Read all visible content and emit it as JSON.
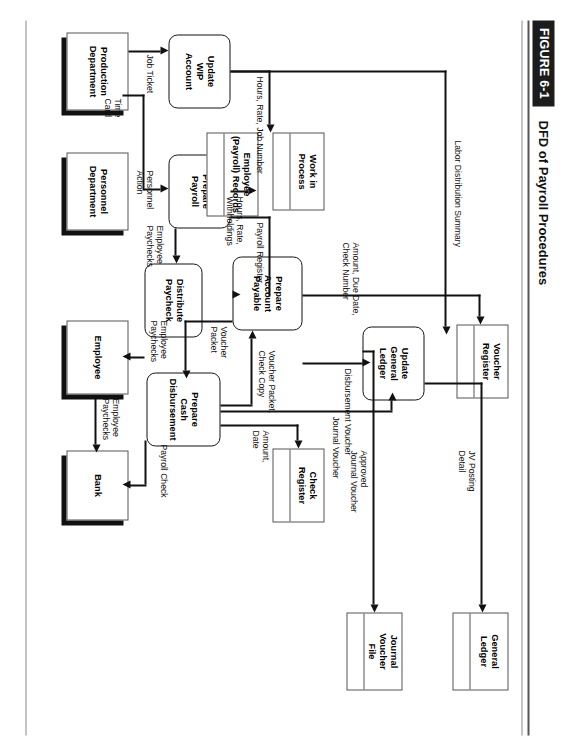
{
  "figure": {
    "badge": "FIGURE 6-1",
    "title": "DFD of Payroll Procedures"
  },
  "diagram": {
    "type": "data-flow-diagram",
    "processes": [
      {
        "id": "update_wip",
        "label": "Update\nWIP\nAccount"
      },
      {
        "id": "prepare_payroll",
        "label": "Prepare\nPayroll"
      },
      {
        "id": "prepare_ap",
        "label": "Prepare\nAccount\nPayable"
      },
      {
        "id": "distribute_paycheck",
        "label": "Distribute\nPaycheck"
      },
      {
        "id": "prepare_cash_disb",
        "label": "Prepare\nCash\nDisbursement"
      },
      {
        "id": "update_gl",
        "label": "Update\nGeneral\nLedger"
      }
    ],
    "data_stores": [
      {
        "id": "work_in_process",
        "label": "Work in\nProcess"
      },
      {
        "id": "employee_payroll_records",
        "label": "Employee\n(Payroll) Records"
      },
      {
        "id": "voucher_register",
        "label": "Voucher\nRegister"
      },
      {
        "id": "check_register",
        "label": "Check\nRegister"
      },
      {
        "id": "general_ledger",
        "label": "General\nLedger"
      },
      {
        "id": "journal_voucher_file",
        "label": "Journal\nVoucher\nFile"
      }
    ],
    "entities": [
      {
        "id": "production_department",
        "label": "Production\nDepartment"
      },
      {
        "id": "personnel_department",
        "label": "Personnel\nDepartment"
      },
      {
        "id": "employee",
        "label": "Employee"
      },
      {
        "id": "bank",
        "label": "Bank"
      }
    ],
    "flows": [
      {
        "id": "job_ticket",
        "label": "Job Ticket"
      },
      {
        "id": "time_card",
        "label": "Time\nCard"
      },
      {
        "id": "personnel_action",
        "label": "Personnel\nAction"
      },
      {
        "id": "hours_rate_job_number",
        "label": "Hours, Rate, Job Number"
      },
      {
        "id": "hours_rate_withholdings",
        "label": "Hours, Rate,\nWithholdings"
      },
      {
        "id": "labor_distribution_summary",
        "label": "Labor Distribution Summary"
      },
      {
        "id": "payroll_register",
        "label": "Payroll Register"
      },
      {
        "id": "employee_paychecks_1",
        "label": "Employee\nPaychecks"
      },
      {
        "id": "employee_paychecks_2",
        "label": "Employee\nPaychecks"
      },
      {
        "id": "employee_paychecks_3",
        "label": "Employee\nPaychecks"
      },
      {
        "id": "amount_due_date_check_number",
        "label": "Amount, Due Date,\nCheck Number"
      },
      {
        "id": "voucher_packet",
        "label": "Voucher\nPacket"
      },
      {
        "id": "voucher_packet_check_copy",
        "label": "Voucher Packet,\nCheck Copy"
      },
      {
        "id": "amount_date",
        "label": "Amount,\nDate"
      },
      {
        "id": "payroll_check",
        "label": "Payroll Check"
      },
      {
        "id": "journal_voucher",
        "label": "Journal Voucher"
      },
      {
        "id": "disbursement_voucher",
        "label": "Disbursement Voucher"
      },
      {
        "id": "jv_posting_detail",
        "label": "JV Posting\nDetail"
      },
      {
        "id": "approved_journal_voucher",
        "label": "Approved\nJournal Voucher"
      }
    ]
  },
  "colors": {
    "ink": "#111111",
    "rule": "#555555",
    "badge_bg": "#1c1c1c",
    "badge_fg": "#ffffff",
    "paper": "#ffffff"
  }
}
